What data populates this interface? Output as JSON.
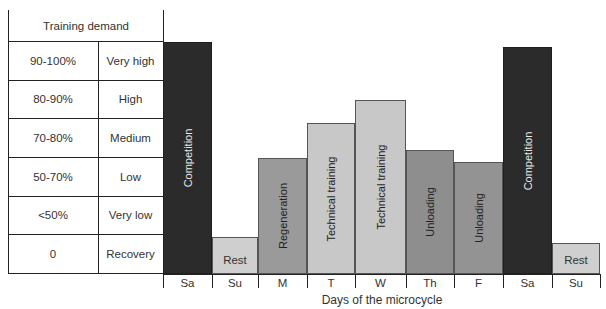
{
  "table": {
    "header": "Training demand",
    "rows": [
      {
        "range": "90-100%",
        "level": "Very high"
      },
      {
        "range": "80-90%",
        "level": "High"
      },
      {
        "range": "70-80%",
        "level": "Medium"
      },
      {
        "range": "50-70%",
        "level": "Low"
      },
      {
        "range": "<50%",
        "level": "Very low"
      },
      {
        "range": "0",
        "level": "Recovery"
      }
    ]
  },
  "colors": {
    "competition": "#2b2b2b",
    "rest": "#cfcfcf",
    "regeneration": "#9a9a9a",
    "technical": "#c8c8c8",
    "unloading": "#8c8c8c"
  },
  "chart_data": {
    "type": "bar",
    "title": "",
    "xlabel": "Days of the microcycle",
    "ylabel": "Training demand",
    "categories": [
      "Sa",
      "Su",
      "M",
      "T",
      "W",
      "Th",
      "F",
      "Sa",
      "Su"
    ],
    "bar_labels": [
      "Competition",
      "Rest",
      "Regeneration",
      "Technical training",
      "Technical training",
      "Unloading",
      "Unloading",
      "Competition",
      "Rest"
    ],
    "values": [
      99,
      10,
      60,
      78,
      88,
      64,
      58,
      97,
      8
    ],
    "y_bands": [
      {
        "range": "90-100%",
        "level": "Very high"
      },
      {
        "range": "80-90%",
        "level": "High"
      },
      {
        "range": "70-80%",
        "level": "Medium"
      },
      {
        "range": "50-70%",
        "level": "Low"
      },
      {
        "range": "<50%",
        "level": "Very low"
      },
      {
        "range": "0",
        "level": "Recovery"
      }
    ],
    "grid": false,
    "legend": "none"
  },
  "bars": [
    {
      "day": "Sa",
      "label": "Competition",
      "x": 163,
      "w": 49,
      "top": 42,
      "color": "#2b2b2b",
      "text": "#e8e8e8",
      "orient": "v"
    },
    {
      "day": "Su",
      "label": "Rest",
      "x": 212,
      "w": 46,
      "top": 237,
      "color": "#cfcfcf",
      "text": "#333",
      "orient": "h"
    },
    {
      "day": "M",
      "label": "Regeneration",
      "x": 258,
      "w": 49,
      "top": 158,
      "color": "#9a9a9a",
      "text": "#222",
      "orient": "v"
    },
    {
      "day": "T",
      "label": "Technical training",
      "x": 307,
      "w": 48,
      "top": 123,
      "color": "#c8c8c8",
      "text": "#222",
      "orient": "v"
    },
    {
      "day": "W",
      "label": "Technical training",
      "x": 355,
      "w": 51,
      "top": 100,
      "color": "#c8c8c8",
      "text": "#222",
      "orient": "v"
    },
    {
      "day": "Th",
      "label": "Unloading",
      "x": 406,
      "w": 48,
      "top": 150,
      "color": "#8e8e8e",
      "text": "#222",
      "orient": "v"
    },
    {
      "day": "F",
      "label": "Unloading",
      "x": 454,
      "w": 49,
      "top": 162,
      "color": "#939393",
      "text": "#222",
      "orient": "v"
    },
    {
      "day": "Sa",
      "label": "Competition",
      "x": 503,
      "w": 49,
      "top": 47,
      "color": "#2b2b2b",
      "text": "#e8e8e8",
      "orient": "v"
    },
    {
      "day": "Su",
      "label": "Rest",
      "x": 552,
      "w": 48,
      "top": 243,
      "color": "#cfcfcf",
      "text": "#333",
      "orient": "h"
    }
  ]
}
